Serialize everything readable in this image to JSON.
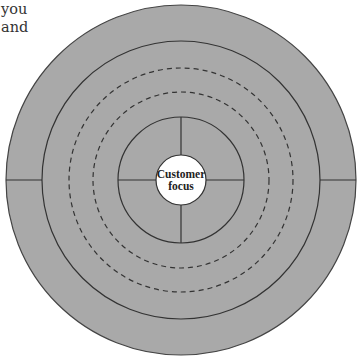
{
  "text_fragment": {
    "lines": [
      "you",
      "and"
    ]
  },
  "diagram": {
    "core_label_line1": "Customer",
    "core_label_line2": "focus",
    "colors": {
      "ring_fill": "#a9a9a9",
      "stroke": "#333333",
      "core_fill": "#ffffff",
      "background": "#ffffff"
    },
    "rings": [
      {
        "radius": 175,
        "style": "solid"
      },
      {
        "radius": 139,
        "style": "solid"
      },
      {
        "radius": 112,
        "style": "dashed"
      },
      {
        "radius": 88,
        "style": "dashed"
      },
      {
        "radius": 63,
        "style": "solid",
        "divided": "quadrants"
      },
      {
        "radius": 25,
        "style": "solid",
        "fill": "white"
      }
    ]
  }
}
